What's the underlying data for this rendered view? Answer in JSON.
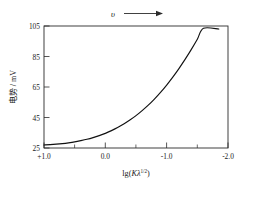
{
  "chart_data": {
    "type": "line",
    "title": "",
    "xlabel": "lg(Kλ1/2)",
    "xlabel_parts": {
      "prefix": "lg(",
      "k": "K",
      "lambda": "λ",
      "exponent": "1/2",
      "suffix": ")"
    },
    "ylabel": "电势 / mV",
    "ylabel_parts": {
      "quantity": "电势",
      "separator": "/",
      "unit": "mV"
    },
    "xticks": [
      "+1.0",
      "0.0",
      "-1.0",
      "-2.0"
    ],
    "xtick_values": [
      1.0,
      0.0,
      -1.0,
      -2.0
    ],
    "xminor_values": [
      0.5,
      -0.5,
      -1.5
    ],
    "yticks": [
      "25",
      "45",
      "65",
      "85",
      "105"
    ],
    "ytick_values": [
      25,
      45,
      65,
      85,
      105
    ],
    "xlim": [
      1.0,
      -2.0
    ],
    "ylim": [
      25,
      105
    ],
    "x_axis_direction": "decreasing",
    "grid": false,
    "legend": false,
    "annotation": {
      "symbol": "υ",
      "arrow": "right-arrow",
      "meaning": "direction of increasing scan rate"
    },
    "series": [
      {
        "name": "potential-curve",
        "color": "#111111",
        "x": [
          1.0,
          0.9,
          0.8,
          0.7,
          0.6,
          0.5,
          0.4,
          0.3,
          0.2,
          0.1,
          0.0,
          -0.1,
          -0.2,
          -0.3,
          -0.4,
          -0.5,
          -0.6,
          -0.7,
          -0.8,
          -0.9,
          -1.0,
          -1.1,
          -1.2,
          -1.3,
          -1.4,
          -1.5,
          -1.6,
          -1.7,
          -1.85
        ],
        "y": [
          27.0,
          27.2,
          27.5,
          27.9,
          28.4,
          29.0,
          29.8,
          30.7,
          31.8,
          33.1,
          34.6,
          36.4,
          38.4,
          40.7,
          43.3,
          46.2,
          49.5,
          53.1,
          57.1,
          61.5,
          66.3,
          71.5,
          77.1,
          83.1,
          89.5,
          96.3,
          103.5,
          111.0,
          103.0
        ]
      }
    ]
  }
}
